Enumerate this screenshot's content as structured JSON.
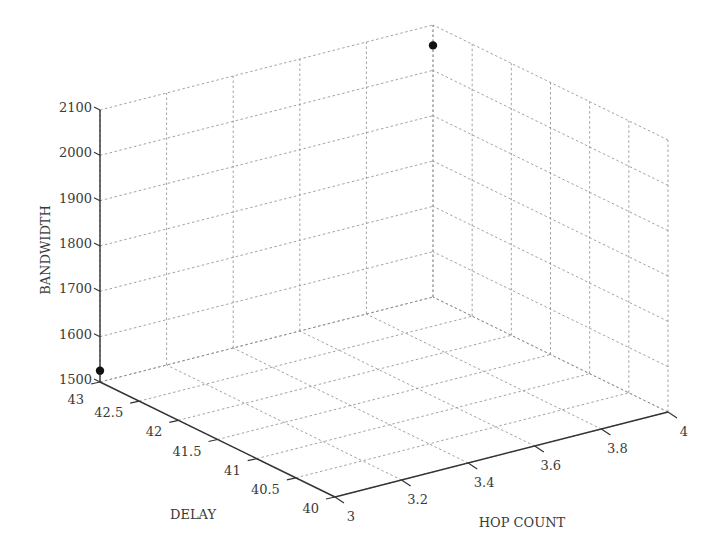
{
  "chart_data": {
    "type": "scatter",
    "dimensions": "3d",
    "title": "",
    "xlabel": "HOP COUNT",
    "ylabel": "DELAY",
    "zlabel": "BANDWIDTH",
    "x_ticks": [
      "3",
      "3.2",
      "3.4",
      "3.6",
      "3.8",
      "4"
    ],
    "y_ticks": [
      "40",
      "40.5",
      "41",
      "41.5",
      "42",
      "42.5",
      "43"
    ],
    "z_ticks": [
      "1500",
      "1600",
      "1700",
      "1800",
      "1900",
      "2000",
      "2100"
    ],
    "xlim": [
      3,
      4
    ],
    "ylim": [
      40,
      43
    ],
    "zlim": [
      1500,
      2100
    ],
    "grid": true,
    "legend": null,
    "points": [
      {
        "hop_count": 3,
        "delay": 43,
        "bandwidth": 1525
      },
      {
        "hop_count": 4,
        "delay": 43,
        "bandwidth": 2055
      }
    ],
    "marker_color": "#111111"
  }
}
